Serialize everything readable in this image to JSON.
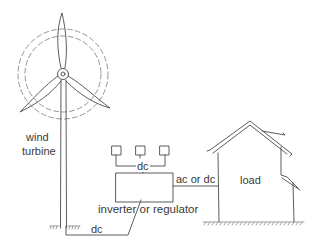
{
  "diagram": {
    "labels": {
      "turbine_line1": "wind",
      "turbine_line2": "turbine",
      "panel_bus": "dc",
      "inverter": "inverter or regulator",
      "house_link": "ac or dc",
      "turbine_link": "dc",
      "house": "load"
    },
    "components": [
      {
        "id": "wind-turbine",
        "label": "wind turbine"
      },
      {
        "id": "solar-panels",
        "count": 3
      },
      {
        "id": "inverter-regulator",
        "label": "inverter or regulator"
      },
      {
        "id": "house",
        "label": "load"
      }
    ],
    "connections": [
      {
        "from": "wind-turbine",
        "to": "inverter-regulator",
        "label": "dc"
      },
      {
        "from": "solar-panels",
        "to": "inverter-regulator",
        "label": "dc"
      },
      {
        "from": "inverter-regulator",
        "to": "house",
        "label": "ac or dc"
      }
    ],
    "colors": {
      "stroke": "#4a4a4a",
      "background": "#ffffff"
    }
  }
}
